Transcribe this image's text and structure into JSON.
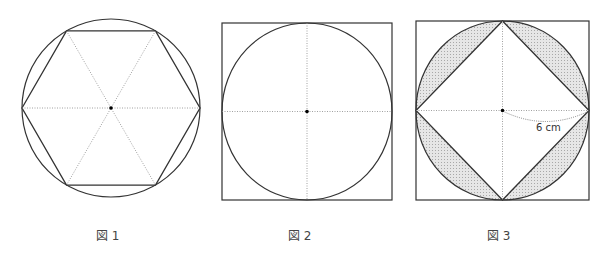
{
  "figures": [
    {
      "caption": "図 1",
      "description": "Regular hexagon inscribed in a circle with three dotted diagonals through the center",
      "shape": "hexagon-in-circle"
    },
    {
      "caption": "図 2",
      "description": "Circle inscribed in a square with dotted horizontal and vertical diameters",
      "shape": "circle-in-square"
    },
    {
      "caption": "図 3",
      "description": "Circle inscribed in a square, with a square (rotated 45°) inscribed in the circle; the four circular segments between the inner square and the circle are shaded",
      "shape": "square-in-circle-in-square",
      "radius_label": "6 cm"
    }
  ],
  "colors": {
    "stroke": "#333333",
    "dotted": "#888888",
    "shade": "#d9d9d9"
  }
}
